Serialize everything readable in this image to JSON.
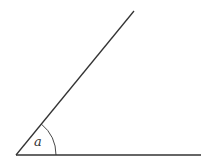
{
  "diagram": {
    "type": "angle",
    "angle_label": "a",
    "vertex": [
      16,
      155
    ],
    "ray_upper_end": [
      134,
      11
    ],
    "ray_base_end": [
      201,
      155
    ],
    "arc_radius": 40,
    "colors": {
      "stroke": "#333333",
      "background": "#ffffff"
    }
  }
}
